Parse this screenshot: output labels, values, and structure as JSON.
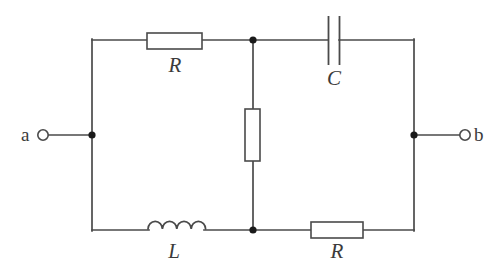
{
  "diagram": {
    "type": "electrical-circuit-schematic",
    "background_color": "#ffffff",
    "line_color": "#4a4a4a",
    "node_color": "#1a1a1a"
  },
  "terminals": [
    {
      "id": "a",
      "label": "a",
      "side": "left",
      "x": 42,
      "y": 135
    },
    {
      "id": "b",
      "label": "b",
      "side": "right",
      "x": 466,
      "y": 135
    }
  ],
  "components": [
    {
      "id": "R-top",
      "kind": "resistor",
      "label": "R",
      "orientation": "horizontal",
      "branch": "top-left",
      "box": {
        "x": 147,
        "y": 33,
        "width": 55,
        "height": 16
      },
      "label_position": "below"
    },
    {
      "id": "C",
      "kind": "capacitor",
      "label": "C",
      "orientation": "horizontal",
      "branch": "top-right",
      "plates": {
        "left_x": 328,
        "right_x": 339,
        "top_y": 16,
        "bottom_y": 65
      },
      "label_position": "below"
    },
    {
      "id": "R-middle",
      "kind": "resistor",
      "label": "",
      "orientation": "vertical",
      "branch": "middle-shunt",
      "box": {
        "x": 245,
        "y": 109,
        "width": 15,
        "height": 52
      },
      "label_position": "none"
    },
    {
      "id": "L",
      "kind": "inductor",
      "label": "L",
      "orientation": "horizontal",
      "branch": "bottom-left",
      "coil": {
        "start_x": 148,
        "end_x": 205,
        "baseline_y": 229,
        "humps": 4
      },
      "label_position": "below"
    },
    {
      "id": "R-bottom",
      "kind": "resistor",
      "label": "R",
      "orientation": "horizontal",
      "branch": "bottom-right",
      "box": {
        "x": 311,
        "y": 222,
        "width": 52,
        "height": 16
      },
      "label_position": "below"
    }
  ],
  "nodes": [
    {
      "id": "node-a",
      "x": 92,
      "y": 135
    },
    {
      "id": "node-top-mid",
      "x": 253,
      "y": 40
    },
    {
      "id": "node-bot-mid",
      "x": 253,
      "y": 230
    },
    {
      "id": "node-b",
      "x": 414,
      "y": 135
    }
  ],
  "wires": {
    "left_rail": {
      "x": 92,
      "y1": 40,
      "y2": 230
    },
    "right_rail": {
      "x": 414,
      "y1": 40,
      "y2": 230
    },
    "top_rail": {
      "y": 40,
      "x1": 92,
      "x2": 414
    },
    "bottom_rail": {
      "y": 230,
      "x1": 92,
      "x2": 414
    },
    "middle_rail": {
      "x": 253,
      "y1": 40,
      "y2": 230
    },
    "lead_a": {
      "y": 135,
      "x1": 48,
      "x2": 92
    },
    "lead_b": {
      "y": 135,
      "x1": 414,
      "x2": 460
    }
  },
  "labels": {
    "resistor_top": "R",
    "capacitor": "C",
    "inductor": "L",
    "resistor_bottom": "R",
    "terminal_a": "a",
    "terminal_b": "b"
  }
}
